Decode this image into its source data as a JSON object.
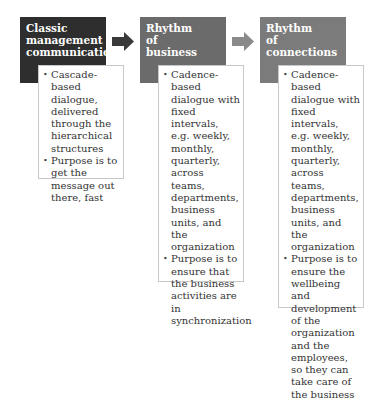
{
  "colors": {
    "col1_head": "#2e2e2e",
    "col2_head": "#6b6b6b",
    "col3_head": "#7b7b7b",
    "arrow1": "#3a3a3a",
    "arrow2": "#8a8a8a",
    "border": "#c8c8c8"
  },
  "columns": [
    {
      "title": "Classic management communication",
      "bullets": [
        "Cascade-based dialogue, delivered through the hierarchical structures",
        "Purpose is to get the message out there, fast"
      ]
    },
    {
      "title": "Rhythm of business",
      "bullets": [
        "Cadence-based dialogue with fixed intervals, e.g. weekly, monthly, quarterly, across teams, departments, business units, and the organization",
        "Purpose is to ensure that the business activities are in synchronization"
      ]
    },
    {
      "title": "Rhythm of connections",
      "bullets": [
        "Cadence-based dialogue with fixed intervals, e.g. weekly, monthly, quarterly, across teams, departments, business units, and the organization",
        "Purpose is to ensure the wellbeing and development of the organization and the employees, so they can take care of the business"
      ]
    }
  ]
}
